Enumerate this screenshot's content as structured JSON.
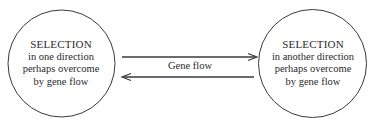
{
  "diagram": {
    "type": "flow",
    "colors": {
      "stroke": "#3a3a3a",
      "text": "#2a2a2a",
      "background": "#ffffff"
    },
    "nodes": [
      {
        "id": "left",
        "shape": "circle",
        "title": "SELECTION",
        "lines": [
          "in one direction",
          "perhaps overcome",
          "by gene flow"
        ]
      },
      {
        "id": "right",
        "shape": "circle",
        "title": "SELECTION",
        "lines": [
          "in another direction",
          "perhaps overcome",
          "by gene flow"
        ]
      }
    ],
    "edges": [
      {
        "from": "left",
        "to": "right",
        "label": "Gene flow"
      },
      {
        "from": "right",
        "to": "left",
        "label": ""
      }
    ]
  }
}
